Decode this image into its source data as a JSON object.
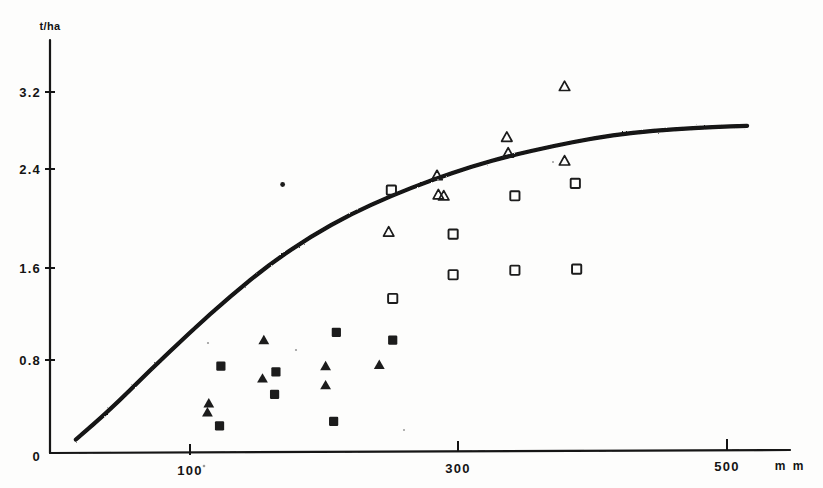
{
  "chart_data": {
    "type": "scatter",
    "title": "",
    "subtitle": "",
    "xlabel": "m m",
    "ylabel": "t/ha",
    "xlim": [
      0,
      560
    ],
    "ylim": [
      0,
      3.7
    ],
    "x_ticks": [
      100,
      300,
      500
    ],
    "x_tick_labels": [
      "100",
      "300",
      "500"
    ],
    "y_ticks": [
      0,
      0.8,
      1.6,
      2.4,
      3.2
    ],
    "y_tick_labels": [
      "0",
      "0.8",
      "1.6",
      "2.4",
      "3.2"
    ],
    "grid": false,
    "legend": "none",
    "axis_color": "#141414",
    "marker_color": "#1a1a1a",
    "curve_color": "#121212",
    "series": [
      {
        "name": "filled-square",
        "marker": "filled square",
        "points": [
          {
            "x": 123,
            "y": 0.77
          },
          {
            "x": 122,
            "y": 0.24
          },
          {
            "x": 164,
            "y": 0.72
          },
          {
            "x": 163,
            "y": 0.52
          },
          {
            "x": 209,
            "y": 1.07
          },
          {
            "x": 207,
            "y": 0.28
          },
          {
            "x": 251,
            "y": 1.0
          }
        ]
      },
      {
        "name": "filled-triangle",
        "marker": "filled triangle",
        "points": [
          {
            "x": 114,
            "y": 0.44
          },
          {
            "x": 113,
            "y": 0.36
          },
          {
            "x": 155,
            "y": 1.0
          },
          {
            "x": 154,
            "y": 0.66
          },
          {
            "x": 201,
            "y": 0.77
          },
          {
            "x": 201,
            "y": 0.6
          },
          {
            "x": 241,
            "y": 0.78
          }
        ]
      },
      {
        "name": "open-square",
        "marker": "open square",
        "points": [
          {
            "x": 250,
            "y": 2.33
          },
          {
            "x": 251,
            "y": 1.37
          },
          {
            "x": 296,
            "y": 1.94
          },
          {
            "x": 296,
            "y": 1.58
          },
          {
            "x": 342,
            "y": 2.28
          },
          {
            "x": 342,
            "y": 1.62
          },
          {
            "x": 388,
            "y": 1.63
          },
          {
            "x": 387,
            "y": 2.39
          }
        ]
      },
      {
        "name": "open-triangle",
        "marker": "open triangle",
        "points": [
          {
            "x": 248,
            "y": 1.96
          },
          {
            "x": 284,
            "y": 2.46
          },
          {
            "x": 285,
            "y": 2.29
          },
          {
            "x": 289,
            "y": 2.28
          },
          {
            "x": 336,
            "y": 2.8
          },
          {
            "x": 337,
            "y": 2.66
          },
          {
            "x": 379,
            "y": 3.25
          },
          {
            "x": 379,
            "y": 2.59
          }
        ]
      },
      {
        "name": "speck",
        "marker": "dot",
        "points": [
          {
            "x": 169,
            "y": 2.38
          }
        ]
      }
    ],
    "fitted_curve": {
      "name": "growth response curve",
      "style": "solid thick hand-drawn",
      "points": [
        {
          "x": 15,
          "y": 0.12
        },
        {
          "x": 40,
          "y": 0.38
        },
        {
          "x": 70,
          "y": 0.73
        },
        {
          "x": 100,
          "y": 1.07
        },
        {
          "x": 130,
          "y": 1.39
        },
        {
          "x": 160,
          "y": 1.68
        },
        {
          "x": 190,
          "y": 1.92
        },
        {
          "x": 220,
          "y": 2.12
        },
        {
          "x": 250,
          "y": 2.28
        },
        {
          "x": 280,
          "y": 2.42
        },
        {
          "x": 310,
          "y": 2.54
        },
        {
          "x": 340,
          "y": 2.64
        },
        {
          "x": 370,
          "y": 2.72
        },
        {
          "x": 400,
          "y": 2.79
        },
        {
          "x": 430,
          "y": 2.84
        },
        {
          "x": 460,
          "y": 2.87
        },
        {
          "x": 490,
          "y": 2.89
        },
        {
          "x": 515,
          "y": 2.9
        }
      ]
    }
  }
}
